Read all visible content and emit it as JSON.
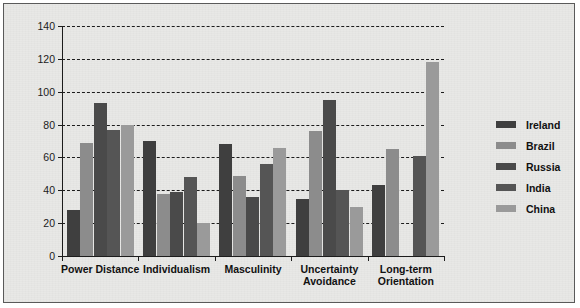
{
  "chart_data": {
    "type": "bar",
    "title": "",
    "xlabel": "",
    "ylabel": "",
    "ylim": [
      0,
      140
    ],
    "ytick_step": 20,
    "yticks": [
      0,
      20,
      40,
      60,
      80,
      100,
      120,
      140
    ],
    "grid": true,
    "legend_position": "right",
    "categories": [
      "Power Distance",
      "Individualism",
      "Masculinity",
      "Uncertainty\nAvoidance",
      "Long-term\nOrientation"
    ],
    "series": [
      {
        "name": "Ireland",
        "color": "#3f3f3f",
        "values": [
          28,
          70,
          68,
          35,
          43
        ]
      },
      {
        "name": "Brazil",
        "color": "#8c8c8c",
        "values": [
          69,
          38,
          49,
          76,
          65
        ]
      },
      {
        "name": "Russia",
        "color": "#4a4a4a",
        "values": [
          93,
          39,
          36,
          95,
          0
        ]
      },
      {
        "name": "India",
        "color": "#555555",
        "values": [
          77,
          48,
          56,
          40,
          61
        ]
      },
      {
        "name": "China",
        "color": "#9a9a9a",
        "values": [
          80,
          20,
          66,
          30,
          118
        ]
      }
    ]
  },
  "legend": {
    "items": [
      {
        "label": "Ireland",
        "color": "#3f3f3f"
      },
      {
        "label": "Brazil",
        "color": "#8c8c8c"
      },
      {
        "label": "Russia",
        "color": "#4a4a4a"
      },
      {
        "label": "India",
        "color": "#555555"
      },
      {
        "label": "China",
        "color": "#9a9a9a"
      }
    ]
  },
  "colors": {
    "background": "#e8e8e6",
    "frame_border": "#5a5a5a",
    "axis": "#1c1c1c",
    "grid": "#1c1c1c",
    "text": "#111111"
  }
}
